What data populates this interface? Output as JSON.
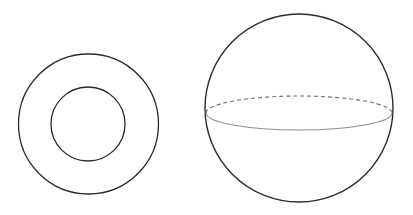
{
  "document": {
    "title": "Geometric Figures: Annulus and Sphere",
    "background_color": "#ffffff",
    "width": 413,
    "height": 215
  },
  "figures": [
    {
      "name": "annulus",
      "label": "Annulus (concentric circles / torus cross-section)",
      "outer_circle": {
        "cx": 88.5,
        "cy": 124,
        "r": 70,
        "stroke": "#2b2b2b",
        "stroke_width": 1.3,
        "fill": "none"
      },
      "inner_circle": {
        "cx": 88,
        "cy": 124,
        "r": 37,
        "stroke": "#2b2b2b",
        "stroke_width": 1.3,
        "fill": "none"
      }
    },
    {
      "name": "sphere",
      "label": "Sphere with equator great circle",
      "outline_circle": {
        "cx": 299,
        "cy": 108,
        "r": 94,
        "stroke": "#2b2b2b",
        "stroke_width": 1.4,
        "fill": "none"
      },
      "equator_back_arc": {
        "description": "dashed upper half of equator ellipse (hidden behind sphere)",
        "cx": 299,
        "cy": 113,
        "rx": 93,
        "ry": 17,
        "stroke": "#6e6e6e",
        "stroke_width": 1.1,
        "dash_pattern": "4 3",
        "fill": "none"
      },
      "equator_front_arc": {
        "description": "solid lower half of equator ellipse (visible front edge)",
        "cx": 299,
        "cy": 113,
        "rx": 93,
        "ry": 17,
        "stroke": "#8d8d8d",
        "stroke_width": 1.1,
        "fill": "none"
      }
    }
  ],
  "colors": {
    "outline_dark": "#2b2b2b",
    "dashed_gray": "#6e6e6e",
    "solid_gray": "#8d8d8d",
    "background": "#ffffff"
  }
}
